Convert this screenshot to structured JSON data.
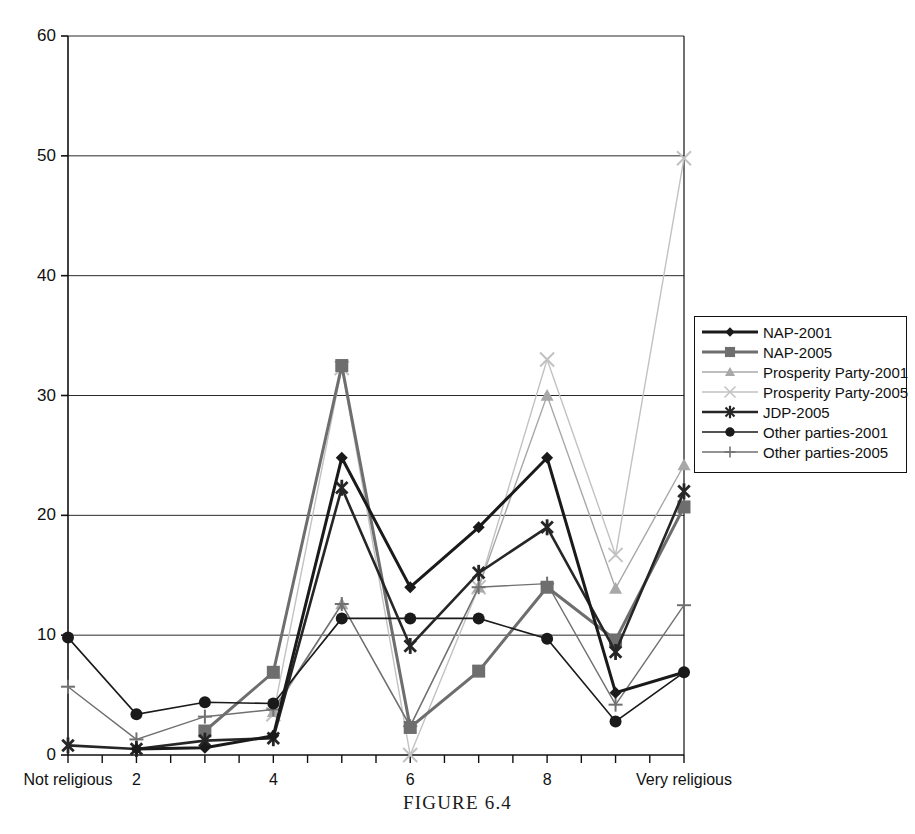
{
  "caption": {
    "text": "FIGURE 6.4"
  },
  "axes": {
    "y_ticks": [
      "0",
      "10",
      "20",
      "30",
      "40",
      "50",
      "60"
    ],
    "x_ticks": [
      "Not religious",
      "2",
      "4",
      "6",
      "8",
      "Very religious"
    ]
  },
  "legend": {
    "items": [
      {
        "label": "NAP-2001",
        "color": "#1a1a1a",
        "marker": "diamond",
        "width": 3.0
      },
      {
        "label": "NAP-2005",
        "color": "#6e6e6e",
        "marker": "square",
        "width": 3.0
      },
      {
        "label": "Prosperity Party-2001",
        "color": "#a8a8a8",
        "marker": "triangle",
        "width": 1.4
      },
      {
        "label": "Prosperity Party-2005",
        "color": "#c2c2c2",
        "marker": "cross-x",
        "width": 1.4
      },
      {
        "label": "JDP-2005",
        "color": "#262626",
        "marker": "asterisk",
        "width": 2.6
      },
      {
        "label": "Other parties-2001",
        "color": "#1a1a1a",
        "marker": "circle",
        "width": 1.6
      },
      {
        "label": "Other parties-2005",
        "color": "#707070",
        "marker": "plus",
        "width": 1.4
      }
    ]
  },
  "chart_data": {
    "type": "line",
    "title": "",
    "xlabel": "",
    "ylabel": "",
    "ylim": [
      0,
      60
    ],
    "yticks": [
      0,
      10,
      20,
      30,
      40,
      50,
      60
    ],
    "grid": "horizontal",
    "legend_position": "right",
    "categories": [
      "Not religious",
      "2",
      "3",
      "4",
      "5",
      "6",
      "7",
      "8",
      "9",
      "Very religious"
    ],
    "category_axis_labels": [
      "Not religious",
      "2",
      "4",
      "6",
      "8",
      "Very religious"
    ],
    "series": [
      {
        "name": "NAP-2001",
        "color": "#1a1a1a",
        "marker": "diamond",
        "values": [
          null,
          0.5,
          0.6,
          1.6,
          24.8,
          14.0,
          19.0,
          24.8,
          5.2,
          6.9
        ]
      },
      {
        "name": "NAP-2005",
        "color": "#6e6e6e",
        "marker": "square",
        "values": [
          null,
          null,
          2.0,
          6.9,
          32.5,
          2.3,
          7.0,
          14.0,
          9.6,
          20.7
        ]
      },
      {
        "name": "Prosperity Party-2001",
        "color": "#a8a8a8",
        "marker": "triangle",
        "values": [
          null,
          null,
          null,
          3.6,
          12.6,
          2.4,
          14.0,
          30.0,
          13.9,
          24.2
        ]
      },
      {
        "name": "Prosperity Party-2005",
        "color": "#c2c2c2",
        "marker": "cross-x",
        "values": [
          null,
          null,
          null,
          3.4,
          32.3,
          0.0,
          14.0,
          33.0,
          16.7,
          49.8
        ]
      },
      {
        "name": "JDP-2005",
        "color": "#262626",
        "marker": "asterisk",
        "values": [
          0.8,
          0.5,
          1.2,
          1.4,
          22.3,
          9.1,
          15.2,
          19.0,
          8.6,
          22.0
        ]
      },
      {
        "name": "Other parties-2001",
        "color": "#1a1a1a",
        "marker": "circle",
        "values": [
          9.8,
          3.4,
          4.4,
          4.3,
          11.4,
          11.4,
          11.4,
          9.7,
          2.8,
          6.9
        ]
      },
      {
        "name": "Other parties-2005",
        "color": "#707070",
        "marker": "plus",
        "values": [
          5.7,
          1.3,
          3.2,
          3.8,
          12.6,
          2.4,
          14.0,
          14.3,
          4.2,
          12.5
        ]
      }
    ]
  }
}
